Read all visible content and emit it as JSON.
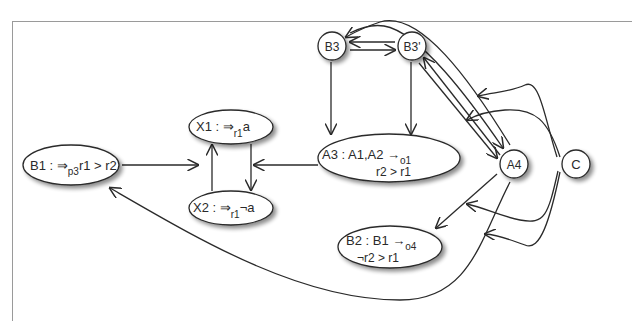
{
  "figure": {
    "caption_visible": "",
    "nodes": [
      {
        "id": "B1",
        "shape": "ellipse",
        "main": "B1 : ⇒",
        "sub": "p3",
        "tail": "r1 > r2"
      },
      {
        "id": "X1",
        "shape": "ellipse",
        "main": "X1 : ⇒",
        "sub": "r1",
        "tail": "a"
      },
      {
        "id": "X2",
        "shape": "ellipse",
        "main": "X2 : ⇒",
        "sub": "r1",
        "tail": "¬a"
      },
      {
        "id": "A3",
        "shape": "ellipse",
        "line1_main": "A3 : A1,A2 →",
        "line1_sub": "o1",
        "line2": "r2 > r1"
      },
      {
        "id": "B3",
        "shape": "circle",
        "label": "B3"
      },
      {
        "id": "B3p",
        "shape": "circle",
        "label": "B3'"
      },
      {
        "id": "A4",
        "shape": "circle",
        "label": "A4"
      },
      {
        "id": "C",
        "shape": "circle",
        "label": "C"
      },
      {
        "id": "B2",
        "shape": "ellipse",
        "line1_main": "B2 : B1 →",
        "line1_sub": "o4",
        "line2": "¬r2 > r1"
      }
    ],
    "edges": [
      {
        "from": "B1",
        "to": "X1/X2 pair"
      },
      {
        "from": "X2",
        "to": "X1"
      },
      {
        "from": "X1",
        "to": "X2"
      },
      {
        "from": "A3",
        "to": "X1/X2 pair"
      },
      {
        "from": "B3",
        "to": "A3"
      },
      {
        "from": "B3p",
        "to": "A3"
      },
      {
        "from": "B3",
        "to": "B3p"
      },
      {
        "from": "B3p",
        "to": "B3"
      },
      {
        "from": "A4",
        "to": "B3"
      },
      {
        "from": "A4",
        "to": "B3p"
      },
      {
        "from": "B3",
        "to": "A4"
      },
      {
        "from": "B3p",
        "to": "A4"
      },
      {
        "from": "A4",
        "to": "B2"
      },
      {
        "from": "A4",
        "to": "B1"
      },
      {
        "from": "C",
        "to": "B3 edge"
      },
      {
        "from": "C",
        "to": "B3p edge"
      },
      {
        "from": "C",
        "to": "A4→B2 edge"
      },
      {
        "from": "C",
        "to": "A4→B1 edge"
      }
    ],
    "colors": {
      "stroke": "#2a2a2a",
      "fill": "#ffffff",
      "shadow": "#9a9a9a",
      "frame": "#9a9a9a"
    }
  }
}
